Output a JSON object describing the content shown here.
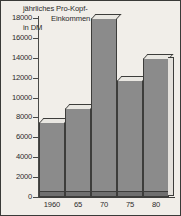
{
  "chart_data": {
    "type": "bar",
    "title_lines": [
      "jährliches Pro-Kopf-",
      "Einkommen",
      "in DM"
    ],
    "xlabel": "",
    "ylabel": "jährliches Pro-Kopf-Einkommen in DM",
    "categories": [
      "1960",
      "65",
      "70",
      "75",
      "80"
    ],
    "values": [
      7500,
      9000,
      18000,
      11800,
      14000
    ],
    "ylim": [
      0,
      18000
    ],
    "yticks": [
      0,
      2000,
      4000,
      6000,
      8000,
      10000,
      12000,
      14000,
      16000,
      18000
    ],
    "ytick_labels": [
      "0",
      "2000",
      "4000",
      "6000",
      "8000",
      "10000",
      "12000",
      "14000",
      "16000",
      "18000"
    ],
    "grid": false,
    "legend": null,
    "style": "3d-bar",
    "colors": {
      "bar_face": "#8b8b8b",
      "bar_top": "#e9e7e2",
      "bar_side": "#e4e1dc",
      "outline": "#3d3d3b",
      "background": "#f1eee9",
      "axis": "#4a4a48",
      "floor": "#6f6f6f",
      "text": "#2b2b2b"
    }
  }
}
